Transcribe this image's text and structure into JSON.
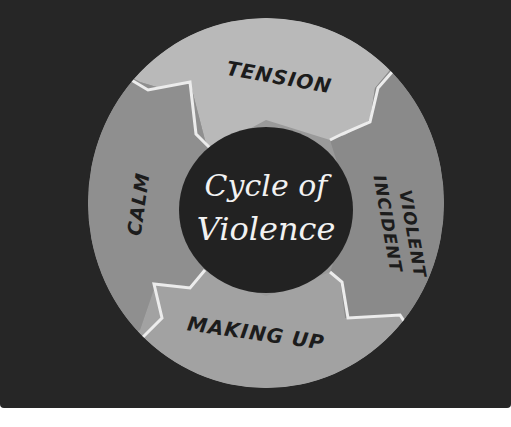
{
  "diagram": {
    "title_line1": "Cycle of",
    "title_line2": "Violence",
    "type": "cycle",
    "segments": [
      {
        "label": "TENSION",
        "position": "top",
        "color": "#b9b9b9"
      },
      {
        "label_line1": "VIOLENT",
        "label_line2": "INCIDENT",
        "position": "right",
        "color": "#8a8a8a"
      },
      {
        "label": "MAKING UP",
        "position": "bottom",
        "color": "#a2a2a2"
      },
      {
        "label": "CALM",
        "position": "left",
        "color": "#8f8f8f"
      }
    ],
    "flow": [
      "TENSION",
      "VIOLENT INCIDENT",
      "MAKING UP",
      "CALM"
    ],
    "colors": {
      "background": "#262626",
      "center_circle": "#222222",
      "divider": "#ececec",
      "text_dark": "#1c1c1c",
      "text_light": "#f2f2f2"
    }
  }
}
